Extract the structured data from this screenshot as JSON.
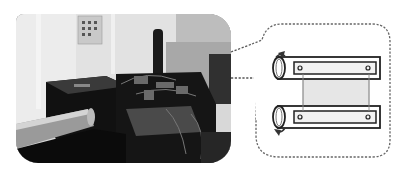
{
  "figure": {
    "photo": {
      "description": "Laboratory test apparatus photograph",
      "tone": "grayscale"
    },
    "callout": {
      "description": "Schematic of two rollers holding a sample strip",
      "border_style": "dashed",
      "border_color": "#666666",
      "roller_count": 2,
      "icons": [
        "rotation-arrow-icon",
        "rotation-arrow-icon"
      ]
    }
  }
}
